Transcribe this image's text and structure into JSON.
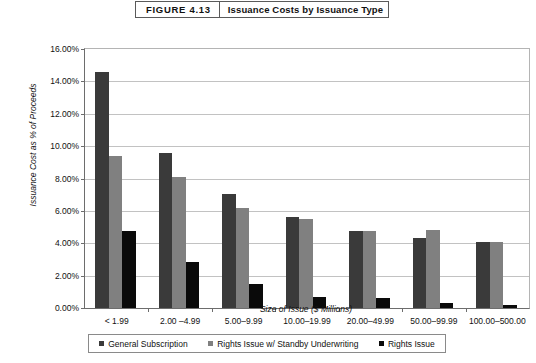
{
  "figure": {
    "number": "FIGURE 4.13",
    "title": "Issuance Costs by Issuance Type"
  },
  "chart_data": {
    "type": "bar",
    "title": "Issuance Costs by Issuance Type",
    "xlabel": "Size of Issue ($ Millions)",
    "ylabel": "Issuance Cost as % of Proceeds",
    "categories": [
      "< 1.99",
      "2.00 –4.99",
      "5.00–9.99",
      "10.00–19.99",
      "20.00–49.99",
      "50.00–99.99",
      "100.00–500.00"
    ],
    "series": [
      {
        "name": "General Subscription",
        "color": "#3a3a3a",
        "values": [
          14.55,
          9.55,
          7.05,
          5.65,
          4.75,
          4.3,
          4.1
        ]
      },
      {
        "name": "Rights Issue w/ Standby Underwriting",
        "color": "#808080",
        "values": [
          9.4,
          8.1,
          6.15,
          5.5,
          4.75,
          4.8,
          4.1
        ]
      },
      {
        "name": "Rights Issue",
        "color": "#0a0a0a",
        "values": [
          4.75,
          2.85,
          1.5,
          0.7,
          0.6,
          0.3,
          0.2
        ]
      }
    ],
    "ylim": [
      0,
      16
    ],
    "ytick_values": [
      0,
      2,
      4,
      6,
      8,
      10,
      12,
      14,
      16
    ],
    "ytick_labels": [
      "0.00%",
      "2.00%",
      "4.00%",
      "6.00%",
      "8.00%",
      "10.00%",
      "12.00%",
      "14.00%",
      "16.00%"
    ],
    "grid": "horizontal",
    "legend_position": "bottom"
  }
}
